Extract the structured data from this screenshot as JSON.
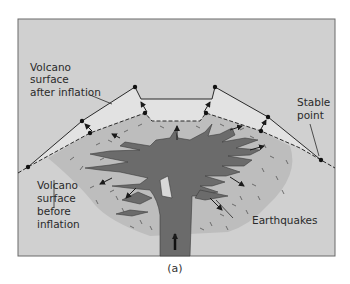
{
  "figure": {
    "caption": "(a)",
    "colors": {
      "background": "#d0d0d0",
      "frame": "#6a6a6a",
      "inflated_zone": "#dedede",
      "pre_inflation_zone": "#bdbdbd",
      "magma": "#6b6b6b",
      "lines": "#2a2a2a"
    },
    "labels": {
      "after_inflation": [
        "Volcano",
        "surface",
        "after inflation"
      ],
      "before_inflation": [
        "Volcano",
        "surface",
        "before",
        "inflation"
      ],
      "stable_point": [
        "Stable",
        "point"
      ],
      "earthquakes": "Earthquakes"
    }
  }
}
